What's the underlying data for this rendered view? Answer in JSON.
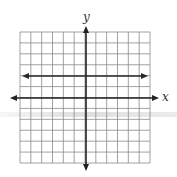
{
  "figure": {
    "title": "",
    "x_axis_label": "x",
    "y_axis_label": "y",
    "grid": {
      "columns": 12,
      "rows": 12,
      "left": 20,
      "top": 32,
      "right": 150,
      "bottom": 163,
      "line_color": "#888888"
    },
    "axes": {
      "x_axis_y": 98,
      "x_axis_from": 10,
      "x_axis_to": 159,
      "y_axis_x": 86,
      "y_axis_from": 26,
      "y_axis_to": 171,
      "color": "#222222"
    },
    "lines": [
      {
        "name": "horizontal line y = 2",
        "description": "Horizontal line two units above the x-axis with arrows on both ends",
        "y_value": 2,
        "pixel_y": 76,
        "from": 22,
        "to": 148
      }
    ]
  }
}
